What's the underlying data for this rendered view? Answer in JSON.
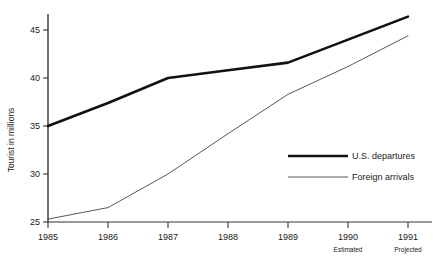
{
  "chart_data": {
    "type": "line",
    "title": "",
    "xlabel": "",
    "ylabel": "Tourist in millions",
    "x": [
      "1985",
      "1986",
      "1987",
      "1988",
      "1989",
      "1990",
      "1991"
    ],
    "x_sublabels": [
      "",
      "",
      "",
      "",
      "",
      "Estimated",
      "Projected"
    ],
    "xlim": [
      1985,
      1991
    ],
    "ylim": [
      25,
      47
    ],
    "yticks": [
      25,
      30,
      35,
      40,
      45
    ],
    "ytick_labels": [
      "25",
      "30",
      "35",
      "40",
      "45"
    ],
    "grid": false,
    "legend_position": "center-right",
    "series": [
      {
        "name": "U.S. departures",
        "values": [
          35.0,
          37.4,
          40.0,
          40.8,
          41.6,
          44.0,
          46.4
        ],
        "color": "#111111",
        "line_width": 2.6
      },
      {
        "name": "Foreign arrivals",
        "values": [
          25.3,
          26.5,
          30.0,
          34.2,
          38.3,
          41.2,
          44.4
        ],
        "color": "#444444",
        "line_width": 0.9
      }
    ]
  },
  "axes": {
    "y_axis_title": "Tourist in millions",
    "y_tick_0": "25",
    "y_tick_1": "30",
    "y_tick_2": "35",
    "y_tick_3": "40",
    "y_tick_4": "45",
    "x_tick_0": "1985",
    "x_tick_1": "1986",
    "x_tick_2": "1987",
    "x_tick_3": "1988",
    "x_tick_4": "1989",
    "x_tick_5": "1990",
    "x_tick_6": "1991",
    "x_sub_5": "Estimated",
    "x_sub_6": "Projected"
  },
  "legend": {
    "entry_0_label": "U.S. departures",
    "entry_1_label": "Foreign arrivals"
  }
}
